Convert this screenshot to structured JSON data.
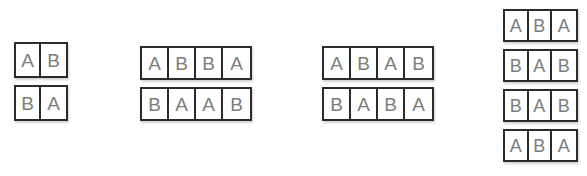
{
  "figure": {
    "background_color": "#ffffff",
    "border_color": "#2b2b2b",
    "letter_color": "#7d7d7d"
  },
  "groups": [
    {
      "id": "group-1",
      "columns": 2,
      "rows": [
        {
          "id": "group-1-row-1",
          "letters": [
            "A",
            "B"
          ]
        },
        {
          "id": "group-1-row-2",
          "letters": [
            "B",
            "A"
          ]
        }
      ]
    },
    {
      "id": "group-2",
      "columns": 4,
      "rows": [
        {
          "id": "group-2-row-1",
          "letters": [
            "A",
            "B",
            "B",
            "A"
          ]
        },
        {
          "id": "group-2-row-2",
          "letters": [
            "B",
            "A",
            "A",
            "B"
          ]
        }
      ]
    },
    {
      "id": "group-3",
      "columns": 4,
      "rows": [
        {
          "id": "group-3-row-1",
          "letters": [
            "A",
            "B",
            "A",
            "B"
          ]
        },
        {
          "id": "group-3-row-2",
          "letters": [
            "B",
            "A",
            "B",
            "A"
          ]
        }
      ]
    },
    {
      "id": "group-4",
      "columns": 3,
      "rows": [
        {
          "id": "group-4-row-1",
          "letters": [
            "A",
            "B",
            "A"
          ]
        },
        {
          "id": "group-4-row-2",
          "letters": [
            "B",
            "A",
            "B"
          ]
        },
        {
          "id": "group-4-row-3",
          "letters": [
            "B",
            "A",
            "B"
          ]
        },
        {
          "id": "group-4-row-4",
          "letters": [
            "A",
            "B",
            "A"
          ]
        }
      ]
    }
  ]
}
